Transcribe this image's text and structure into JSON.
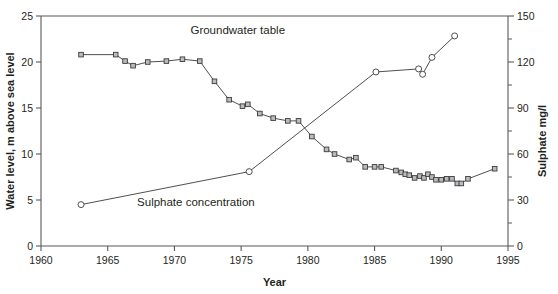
{
  "chart_data": {
    "type": "line",
    "title": "",
    "xlabel": "Year",
    "ylabel": "Water level, m above sea level",
    "y2label": "Sulphate mg/l",
    "xlim": [
      1960,
      1995
    ],
    "ylim": [
      0,
      25
    ],
    "y2lim": [
      0,
      150
    ],
    "xticks": [
      1960,
      1965,
      1970,
      1975,
      1980,
      1985,
      1990,
      1995
    ],
    "yticks": [
      0,
      5,
      10,
      15,
      20,
      25
    ],
    "y2ticks": [
      0,
      30,
      60,
      90,
      120,
      150
    ],
    "y2_minor_step": 15,
    "grid": false,
    "legend": "inline-annotations",
    "series": [
      {
        "name": "Groundwater table",
        "axis": "left",
        "unit": "m above sea level",
        "marker": "square",
        "label_x": 1971.2,
        "label_y": 23.0,
        "points": [
          [
            1963.0,
            20.8
          ],
          [
            1965.6,
            20.8
          ],
          [
            1966.3,
            20.1
          ],
          [
            1966.9,
            19.6
          ],
          [
            1968.0,
            20.0
          ],
          [
            1969.4,
            20.1
          ],
          [
            1970.6,
            20.3
          ],
          [
            1971.9,
            20.1
          ],
          [
            1973.0,
            17.9
          ],
          [
            1974.1,
            15.9
          ],
          [
            1975.1,
            15.2
          ],
          [
            1975.5,
            15.4
          ],
          [
            1976.4,
            14.4
          ],
          [
            1977.4,
            13.9
          ],
          [
            1978.5,
            13.6
          ],
          [
            1979.3,
            13.6
          ],
          [
            1980.3,
            11.9
          ],
          [
            1981.4,
            10.5
          ],
          [
            1982.0,
            10.0
          ],
          [
            1983.1,
            9.4
          ],
          [
            1983.6,
            9.6
          ],
          [
            1984.3,
            8.6
          ],
          [
            1985.0,
            8.6
          ],
          [
            1985.5,
            8.6
          ],
          [
            1986.6,
            8.2
          ],
          [
            1987.0,
            8.0
          ],
          [
            1987.3,
            7.8
          ],
          [
            1987.6,
            7.7
          ],
          [
            1988.0,
            7.4
          ],
          [
            1988.4,
            7.6
          ],
          [
            1988.7,
            7.4
          ],
          [
            1989.0,
            7.8
          ],
          [
            1989.3,
            7.5
          ],
          [
            1989.6,
            7.2
          ],
          [
            1990.0,
            7.2
          ],
          [
            1990.4,
            7.3
          ],
          [
            1990.8,
            7.3
          ],
          [
            1991.2,
            6.8
          ],
          [
            1991.5,
            6.8
          ],
          [
            1992.0,
            7.3
          ],
          [
            1994.0,
            8.4
          ]
        ]
      },
      {
        "name": "Sulphate concentration",
        "axis": "right",
        "unit": "mg/l",
        "marker": "circle",
        "label_x": 1967.2,
        "label_y_left_equiv": 4.3,
        "points": [
          [
            1963.0,
            27.0
          ],
          [
            1975.6,
            48.5
          ],
          [
            1985.1,
            113.5
          ],
          [
            1988.3,
            115.5
          ],
          [
            1988.6,
            112.0
          ],
          [
            1989.3,
            123.0
          ],
          [
            1991.0,
            137.0
          ]
        ]
      }
    ],
    "annotations": [
      {
        "text": "Groundwater table",
        "x": 1971.2,
        "y": 23.0
      },
      {
        "text": "Sulphate concentration",
        "x": 1967.2,
        "y": 4.3
      }
    ]
  },
  "axes": {
    "left": {
      "label": "Water level, m above sea level",
      "tick_labels": [
        "0",
        "5",
        "10",
        "15",
        "20",
        "25"
      ]
    },
    "right": {
      "label": "Sulphate mg/l",
      "tick_labels": [
        "0",
        "30",
        "60",
        "90",
        "120",
        "150"
      ]
    },
    "bottom": {
      "label": "Year",
      "tick_labels": [
        "1960",
        "1965",
        "1970",
        "1975",
        "1980",
        "1985",
        "1990",
        "1995"
      ]
    }
  },
  "colors": {
    "axis": "#58595b",
    "line": "#3b3b3d",
    "square_fill": "#b9bbbd",
    "circle_fill": "#ffffff",
    "text": "#231f20",
    "background": "#ffffff"
  }
}
